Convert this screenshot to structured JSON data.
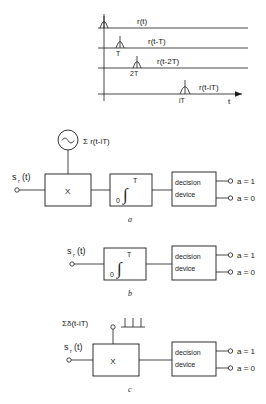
{
  "figure": {
    "caption_a": "a",
    "caption_b": "b",
    "caption_c": "c"
  },
  "timing_chart": {
    "axis_label_t": "t",
    "traces": [
      {
        "signal": "r(t)",
        "tick": ""
      },
      {
        "signal": "r(t-T)",
        "tick": "T"
      },
      {
        "signal": "r(t-2T)",
        "tick": "2T"
      },
      {
        "signal": "r(t-iT)",
        "tick": "iT"
      }
    ]
  },
  "diagram_a": {
    "input_label": "s",
    "input_sub": "r",
    "input_tail": "(t)",
    "oscillator_icon": "sine-wave-icon",
    "source_label": "Σ r(t-iT)",
    "multiplier_label": "X",
    "integrator_upper": "T",
    "integrator_lower": "0",
    "integrator_symbol": "∫",
    "decision_line1": "decision",
    "decision_line2": "device",
    "output_1": "a = 1",
    "output_0": "a = 0"
  },
  "diagram_b": {
    "input_label": "s",
    "input_sub": "r",
    "input_tail": "(t)",
    "integrator_upper": "T",
    "integrator_lower": "0",
    "integrator_symbol": "∫",
    "decision_line1": "decision",
    "decision_line2": "device",
    "output_1": "a = 1",
    "output_0": "a = 0"
  },
  "diagram_c": {
    "input_label": "s",
    "input_sub": "r",
    "input_tail": "(t)",
    "source_label": "Σδ(t-iT)",
    "impulse_train_icon": "impulse-train-icon",
    "multiplier_label": "X",
    "decision_line1": "decision",
    "decision_line2": "device",
    "output_1": "a = 1",
    "output_0": "a = 0"
  },
  "colors": {
    "ink": "#1a1a1a",
    "paper": "#ffffff"
  }
}
